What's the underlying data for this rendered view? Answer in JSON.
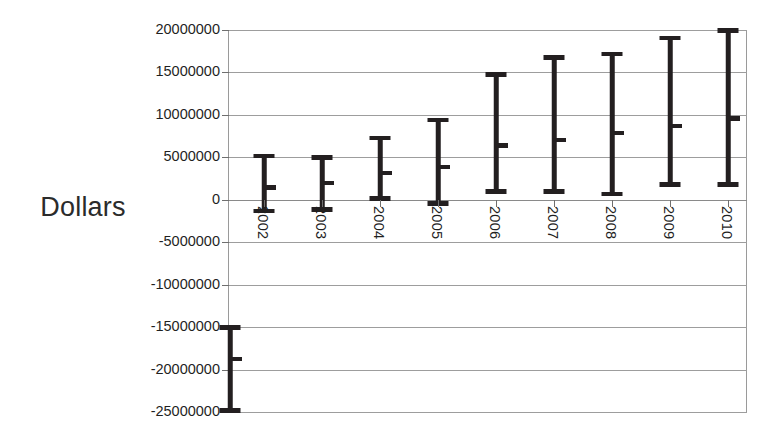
{
  "chart_data": {
    "type": "bar",
    "chart_style": "error-bar-range",
    "title": "",
    "xlabel": "",
    "ylabel": "Dollars",
    "ylim": [
      -25000000,
      20000000
    ],
    "ytick_step": 5000000,
    "grid": true,
    "legend": "none",
    "categories": [
      "2002",
      "2003",
      "2004",
      "2005",
      "2006",
      "2007",
      "2008",
      "2009",
      "2010"
    ],
    "ytick_labels": [
      "20000000",
      "15000000",
      "10000000",
      "5000000",
      "0",
      "-5000000",
      "-10000000",
      "-15000000",
      "-20000000",
      "-25000000"
    ],
    "ytick_values": [
      20000000,
      15000000,
      10000000,
      5000000,
      0,
      -5000000,
      -10000000,
      -15000000,
      -20000000,
      -25000000
    ],
    "series": [
      {
        "name": "Range",
        "low": [
          -1300000,
          -1100000,
          200000,
          -400000,
          1000000,
          1000000,
          700000,
          1800000,
          1800000
        ],
        "mid": [
          1500000,
          2000000,
          3200000,
          3900000,
          6400000,
          7100000,
          7900000,
          8700000,
          9600000
        ],
        "high": [
          5200000,
          5000000,
          7300000,
          9400000,
          14800000,
          16800000,
          17200000,
          19100000,
          20000000
        ]
      }
    ],
    "extra_markers": [
      {
        "name": "axis-range-marker",
        "position": "y-axis",
        "low": -24800000,
        "mid": -18700000,
        "high": -15000000
      }
    ]
  },
  "axis": {
    "y_title": "Dollars"
  }
}
